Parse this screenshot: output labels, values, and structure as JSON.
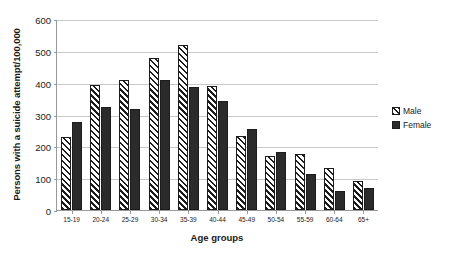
{
  "chart_data": {
    "type": "bar",
    "title": "",
    "xlabel": "Age groups",
    "ylabel": "Persons with a suicide attempt/100,000",
    "categories": [
      "15-19",
      "20-24",
      "25-29",
      "30-34",
      "35-39",
      "40-44",
      "45-49",
      "50-54",
      "55-59",
      "60-64",
      "65+"
    ],
    "series": [
      {
        "name": "Male",
        "values": [
          230,
          393,
          408,
          478,
          518,
          389,
          232,
          170,
          177,
          133,
          92
        ]
      },
      {
        "name": "Female",
        "values": [
          278,
          325,
          318,
          407,
          385,
          343,
          253,
          181,
          114,
          59,
          68
        ]
      }
    ],
    "ylim": [
      0,
      600
    ],
    "yticks": [
      0,
      100,
      200,
      300,
      400,
      500,
      600
    ],
    "ytick_labels": [
      "0",
      "100",
      "200",
      "300",
      "400",
      "500",
      "600"
    ],
    "grid": true,
    "legend_position": "right",
    "colors": {
      "male": "#ffffff",
      "male_hatch": "#1c1c1c",
      "female": "#2b2b2b",
      "gridline": "#c8c8c8",
      "axis": "#9a9a9a",
      "text": "#1a1a1a",
      "background": "#ffffff"
    }
  },
  "legend": {
    "items": [
      {
        "label": "Male"
      },
      {
        "label": "Female"
      }
    ]
  }
}
